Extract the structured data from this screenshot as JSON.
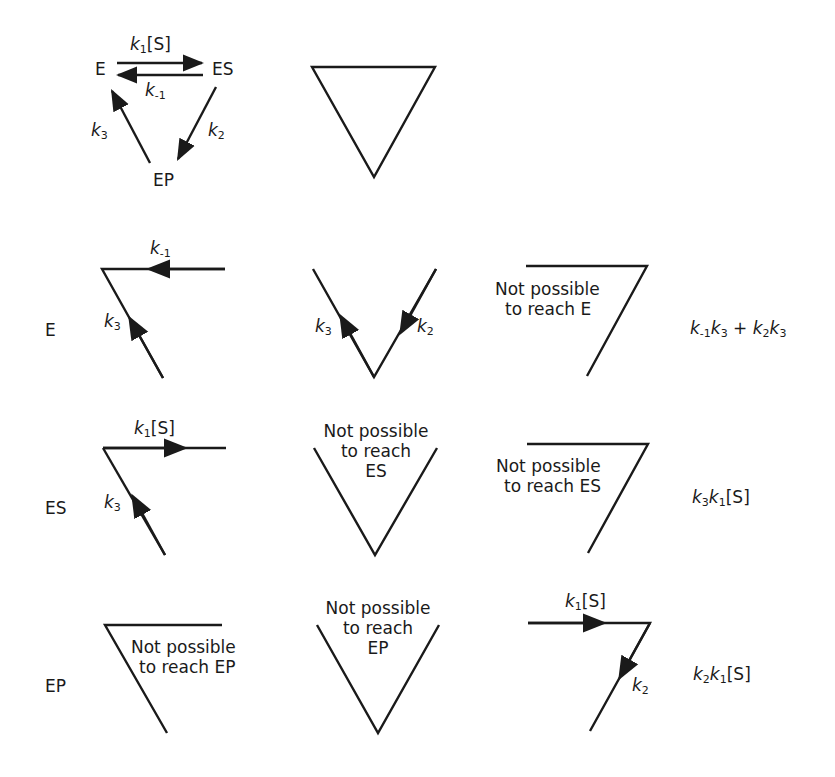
{
  "scheme": {
    "nodes": {
      "E": "E",
      "ES": "ES",
      "EP": "EP"
    },
    "rates": {
      "forward_k": "k",
      "forward_sub": "1",
      "forward_conc": "[S]",
      "reverse_k": "k",
      "reverse_sub": "-1",
      "k2_k": "k",
      "k2_sub": "2",
      "k3_k": "k",
      "k3_sub": "3"
    }
  },
  "rows": {
    "E": {
      "label": "E",
      "col1": {
        "edge_top_k": "k",
        "edge_top_sub": "-1",
        "edge_left_k": "k",
        "edge_left_sub": "3"
      },
      "col2": {
        "edge_left_k": "k",
        "edge_left_sub": "3",
        "edge_right_k": "k",
        "edge_right_sub": "2"
      },
      "col3": {
        "note_line1": "Not possible",
        "note_line2": "to reach E"
      },
      "result": {
        "t1a_k": "k",
        "t1a_sub": "-1",
        "t1b_k": "k",
        "t1b_sub": "3",
        "plus": " + ",
        "t2a_k": "k",
        "t2a_sub": "2",
        "t2b_k": "k",
        "t2b_sub": "3"
      }
    },
    "ES": {
      "label": "ES",
      "col1": {
        "edge_top_k": "k",
        "edge_top_sub": "1",
        "edge_top_conc": "[S]",
        "edge_left_k": "k",
        "edge_left_sub": "3"
      },
      "col2": {
        "note_line1": "Not possible",
        "note_line2": "to reach",
        "note_line3": "ES"
      },
      "col3": {
        "note_line1": "Not possible",
        "note_line2": "to reach ES"
      },
      "result": {
        "a_k": "k",
        "a_sub": "3",
        "b_k": "k",
        "b_sub": "1",
        "conc": "[S]"
      }
    },
    "EP": {
      "label": "EP",
      "col1": {
        "note_line1": "Not possible",
        "note_line2": "to reach EP"
      },
      "col2": {
        "note_line1": "Not possible",
        "note_line2": "to reach",
        "note_line3": "EP"
      },
      "col3": {
        "edge_top_k": "k",
        "edge_top_sub": "1",
        "edge_top_conc": "[S]",
        "edge_right_k": "k",
        "edge_right_sub": "2"
      },
      "result": {
        "a_k": "k",
        "a_sub": "2",
        "b_k": "k",
        "b_sub": "1",
        "conc": "[S]"
      }
    }
  }
}
